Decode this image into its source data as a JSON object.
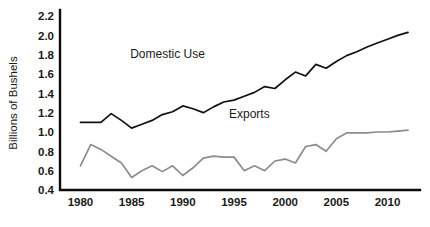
{
  "chart_data": {
    "type": "line",
    "title": "",
    "xlabel": "",
    "ylabel": "Billions of Bushels",
    "xlim": [
      1978,
      2012
    ],
    "ylim": [
      0.4,
      2.2
    ],
    "grid": false,
    "legend_position": "inline-annotations",
    "xticks": [
      "1980",
      "1985",
      "1990",
      "1995",
      "2000",
      "2005",
      "2010"
    ],
    "yticks": [
      "0.4",
      "0.6",
      "0.8",
      "1.0",
      "1.2",
      "1.4",
      "1.6",
      "1.8",
      "2.0",
      "2.2"
    ],
    "x": [
      1980,
      1981,
      1982,
      1983,
      1984,
      1985,
      1986,
      1987,
      1988,
      1989,
      1990,
      1991,
      1992,
      1993,
      1994,
      1995,
      1996,
      1997,
      1998,
      1999,
      2000,
      2001,
      2002,
      2003,
      2004,
      2005,
      2006,
      2007,
      2008,
      2009,
      2010,
      2011,
      2012
    ],
    "series": [
      {
        "name": "Domestic Use",
        "color": "#111111",
        "label_x": 1988.5,
        "label_y": 1.77,
        "values": [
          1.1,
          1.1,
          1.1,
          1.19,
          1.12,
          1.04,
          1.08,
          1.12,
          1.18,
          1.21,
          1.27,
          1.24,
          1.2,
          1.26,
          1.31,
          1.33,
          1.37,
          1.41,
          1.47,
          1.45,
          1.54,
          1.62,
          1.58,
          1.7,
          1.66,
          1.73,
          1.79,
          1.83,
          1.88,
          1.92,
          1.96,
          2.0,
          2.03
        ]
      },
      {
        "name": "Exports",
        "color": "#8c8c8c",
        "label_x": 1996.5,
        "label_y": 1.15,
        "values": [
          0.65,
          0.87,
          0.82,
          0.75,
          0.68,
          0.53,
          0.6,
          0.65,
          0.59,
          0.65,
          0.55,
          0.63,
          0.73,
          0.75,
          0.74,
          0.74,
          0.6,
          0.65,
          0.6,
          0.7,
          0.72,
          0.68,
          0.85,
          0.87,
          0.8,
          0.93,
          0.99,
          0.99,
          0.99,
          1.0,
          1.0,
          1.01,
          1.02
        ]
      }
    ]
  },
  "axes": {
    "y_axis_title": "Billions of Bushels"
  }
}
